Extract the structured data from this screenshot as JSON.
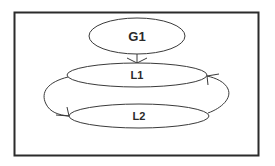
{
  "diagram": {
    "type": "state-graph",
    "colors": {
      "background": "#ffffff",
      "frame": "#2b2b2b",
      "stroke": "#3a3a3a",
      "text": "#2a2a2a"
    },
    "nodes": [
      {
        "id": "G1",
        "label": "G1",
        "shape": "ellipse"
      },
      {
        "id": "L1",
        "label": "L1",
        "shape": "ellipse"
      },
      {
        "id": "L2",
        "label": "L2",
        "shape": "ellipse"
      }
    ],
    "edges": [
      {
        "from": "G1",
        "to": "L1",
        "style": "straight-arrow"
      },
      {
        "from": "L1",
        "to": "L2",
        "style": "curved-arrow-left"
      },
      {
        "from": "L2",
        "to": "L1",
        "style": "curved-arrow-right"
      }
    ]
  }
}
